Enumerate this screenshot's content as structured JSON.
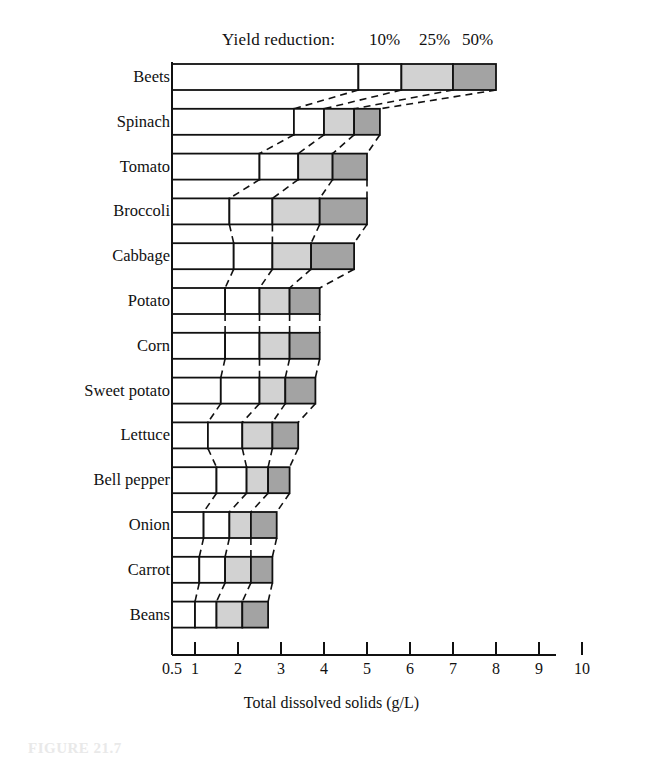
{
  "legend": {
    "title": "Yield reduction:",
    "levels": [
      "10%",
      "25%",
      "50%"
    ]
  },
  "axis": {
    "title": "Total dissolved solids (g/L)",
    "ticks": [
      "0.5",
      "1",
      "2",
      "3",
      "4",
      "5",
      "6",
      "7",
      "8",
      "9",
      "10"
    ]
  },
  "caption": "FIGURE 21.7",
  "colors": {
    "segment_0": "#ffffff",
    "segment_10": "#ffffff",
    "segment_25": "#d2d2d2",
    "segment_50": "#a3a3a3",
    "outline": "#111111",
    "background": "#ffffff"
  },
  "chart_data": {
    "type": "bar",
    "title": "",
    "subtitle": "",
    "xlabel": "Total dissolved solids (g/L)",
    "ylabel": "",
    "xlim": [
      0.5,
      10
    ],
    "grid": false,
    "legend_position": "top",
    "orientation": "horizontal",
    "note": "Stacked horizontal ranges: each crop bar is divided at the TDS values producing 10%, 25% and 50% yield reduction. Bars start at the axis origin (0.5 g/L).",
    "categories": [
      "Beets",
      "Spinach",
      "Tomato",
      "Broccoli",
      "Cabbage",
      "Potato",
      "Corn",
      "Sweet potato",
      "Lettuce",
      "Bell pepper",
      "Onion",
      "Carrot",
      "Beans"
    ],
    "series": [
      {
        "name": "10%",
        "values": [
          4.8,
          3.3,
          2.5,
          1.8,
          1.9,
          1.7,
          1.7,
          1.6,
          1.3,
          1.5,
          1.2,
          1.1,
          1.0
        ]
      },
      {
        "name": "25%",
        "values": [
          5.8,
          4.0,
          3.4,
          2.8,
          2.8,
          2.5,
          2.5,
          2.5,
          2.1,
          2.2,
          1.8,
          1.7,
          1.5
        ]
      },
      {
        "name": "50%",
        "values": [
          7.0,
          4.7,
          4.2,
          3.9,
          3.7,
          3.2,
          3.2,
          3.1,
          2.8,
          2.7,
          2.3,
          2.3,
          2.1
        ]
      },
      {
        "name": "max",
        "values": [
          8.0,
          5.3,
          5.0,
          5.0,
          4.7,
          3.9,
          3.9,
          3.8,
          3.4,
          3.2,
          2.9,
          2.8,
          2.7
        ]
      }
    ]
  }
}
